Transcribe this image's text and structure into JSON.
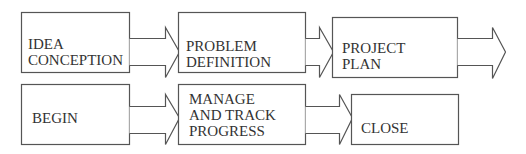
{
  "diagram": {
    "type": "process-flow",
    "stroke_color": "#555555",
    "text_color": "#333333",
    "rows": [
      {
        "steps": [
          {
            "id": "idea",
            "lines": [
              "IDEA",
              "CONCEPTION"
            ]
          },
          {
            "id": "problem",
            "lines": [
              "PROBLEM",
              "DEFINITION"
            ]
          },
          {
            "id": "plan",
            "lines": [
              "PROJECT",
              "PLAN"
            ]
          }
        ],
        "trailing_arrow": true
      },
      {
        "steps": [
          {
            "id": "begin",
            "lines": [
              "BEGIN"
            ]
          },
          {
            "id": "manage",
            "lines": [
              "MANAGE",
              "AND TRACK",
              "PROGRESS"
            ]
          },
          {
            "id": "close",
            "lines": [
              "CLOSE"
            ]
          }
        ],
        "trailing_arrow": false
      }
    ]
  }
}
